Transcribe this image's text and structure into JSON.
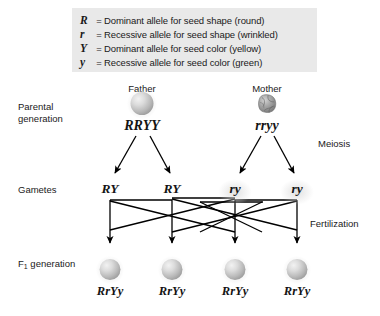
{
  "legend": {
    "rows": [
      {
        "symbol": "R",
        "eq": "=",
        "text": "Dominant allele for seed shape (round)"
      },
      {
        "symbol": "r",
        "eq": "=",
        "text": "Recessive allele for seed shape (wrinkled)"
      },
      {
        "symbol": "Y",
        "eq": "=",
        "text": "Dominant allele for seed color (yellow)"
      },
      {
        "symbol": "y",
        "eq": "=",
        "text": "Recessive allele for seed color (green)"
      }
    ],
    "background": "#e9e9e9"
  },
  "rows": {
    "parental_line1": "Parental",
    "parental_line2": "generation",
    "gametes": "Gametes",
    "f1_prefix": "F",
    "f1_sub": "1",
    "f1_suffix": " generation"
  },
  "process_labels": {
    "meiosis": "Meiosis",
    "fertilization": "Fertilization"
  },
  "parents": [
    {
      "title": "Father",
      "genotype": "RRYY",
      "seed_icon": "round-seed-icon",
      "x": 142
    },
    {
      "title": "Mother",
      "genotype": "rryy",
      "seed_icon": "wrinkled-seed-icon",
      "x": 267
    }
  ],
  "gametes": [
    {
      "genotype": "RY",
      "x": 110,
      "from": "Father"
    },
    {
      "genotype": "RY",
      "x": 172,
      "from": "Father"
    },
    {
      "genotype": "ry",
      "x": 235,
      "from": "Mother"
    },
    {
      "genotype": "ry",
      "x": 297,
      "from": "Mother"
    }
  ],
  "f1_offspring": [
    {
      "genotype": "RrYy",
      "seed_icon": "round-seed-icon",
      "x": 110
    },
    {
      "genotype": "RrYy",
      "seed_icon": "round-seed-icon",
      "x": 172
    },
    {
      "genotype": "RrYy",
      "seed_icon": "round-seed-icon",
      "x": 235
    },
    {
      "genotype": "RrYy",
      "seed_icon": "round-seed-icon",
      "x": 297
    }
  ],
  "colors": {
    "line": "#000000",
    "text": "#1a1a1a",
    "seed_light": "#f2f2f2",
    "seed_mid": "#b9b9b9",
    "seed_dark": "#8c8c8c",
    "wrinkled_seed": "#8e8e8e"
  }
}
